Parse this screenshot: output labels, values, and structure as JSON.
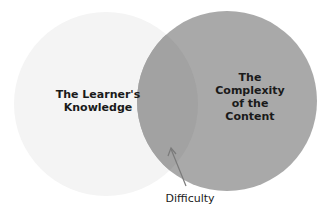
{
  "diagram": {
    "type": "venn",
    "circles": [
      {
        "id": "left",
        "label": "The Learner's Knowledge",
        "line1": "The Learner's",
        "line2": "Knowledge",
        "fill": "#f4f4f4"
      },
      {
        "id": "right",
        "label": "The Complexity of the Content",
        "line1": "The",
        "line2": "Complexity",
        "line3": "of the",
        "line4": "Content",
        "fill": "#a9a9a9"
      }
    ],
    "overlap": {
      "label": "Difficulty",
      "fill": "#a3a3a3"
    },
    "arrow_color": "#7a7a7a"
  }
}
